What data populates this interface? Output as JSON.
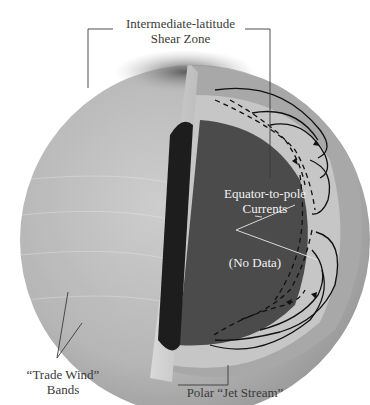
{
  "diagram": {
    "labels": {
      "shear_zone": {
        "line1": "Intermediate-latitude",
        "line2": "Shear Zone"
      },
      "currents": {
        "line1": "Equator-to-pole",
        "line2": "Currents"
      },
      "no_data": "(No Data)",
      "trade_wind": {
        "line1": "“Trade Wind”",
        "line2": "Bands"
      },
      "jet_stream": "Polar “Jet Stream”"
    },
    "colors": {
      "background": "#ffffff",
      "sphere_surface": "#b9b9b9",
      "polar_cap": "#6e6e6e",
      "outer_shell": "#a6a6a6",
      "flow_layer": "#c8c8c8",
      "core": "#4a4a4a",
      "cut_face_dark": "#1e1e1e",
      "leader_line": "#3a3a3a",
      "flow_lines": "#111111"
    }
  }
}
